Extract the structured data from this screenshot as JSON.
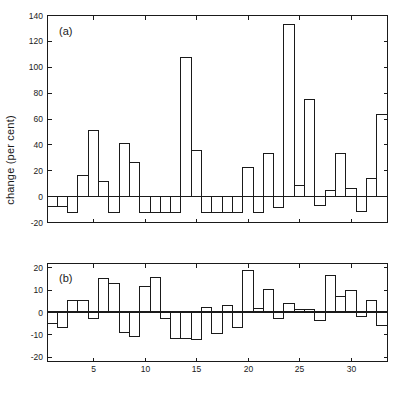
{
  "figure": {
    "ylabel": "change (per cent)",
    "background": "#ffffff",
    "ink_color": "#1a1a1a"
  },
  "chart_data": [
    {
      "type": "bar",
      "panel": "a",
      "title": "(a)",
      "xlabel": "",
      "ylabel": "change (per cent)",
      "ylim": [
        -20,
        140
      ],
      "yticks": [
        -20,
        0,
        20,
        40,
        60,
        80,
        100,
        120,
        140
      ],
      "yticklabels": [
        "-20",
        "0",
        "20",
        "40",
        "60",
        "80",
        "100",
        "120",
        "140"
      ],
      "xlim": [
        0.5,
        33.5
      ],
      "xticks": [
        5,
        10,
        15,
        20,
        25,
        30
      ],
      "xticklabels": [
        "",
        "",
        "",
        "",
        "",
        ""
      ],
      "grid": false,
      "legend": null,
      "categories": [
        1,
        2,
        3,
        4,
        5,
        6,
        7,
        8,
        9,
        10,
        11,
        12,
        13,
        14,
        15,
        16,
        17,
        18,
        19,
        20,
        21,
        22,
        23,
        24,
        25,
        26,
        27,
        28,
        29,
        30,
        31,
        32,
        33
      ],
      "values": [
        -8,
        -8,
        -13,
        16,
        51,
        11,
        -13,
        41,
        26,
        -13,
        -13,
        -13,
        -13,
        107,
        35,
        -13,
        -13,
        -13,
        -13,
        22,
        -13,
        33,
        -9,
        133,
        8,
        75,
        -7,
        4,
        33,
        6,
        -12,
        14,
        63,
        21,
        -7,
        -12,
        8
      ]
    },
    {
      "type": "bar",
      "panel": "b",
      "title": "(b)",
      "xlabel": "",
      "ylabel": "",
      "ylim": [
        -22,
        22
      ],
      "yticks": [
        -20,
        -10,
        0,
        10,
        20
      ],
      "yticklabels": [
        "-20",
        "-10",
        "0",
        "10",
        "20"
      ],
      "xlim": [
        0.5,
        33.5
      ],
      "xticks": [
        5,
        10,
        15,
        20,
        25,
        30
      ],
      "xticklabels": [
        "5",
        "10",
        "15",
        "20",
        "25",
        "30"
      ],
      "grid": false,
      "legend": null,
      "categories": [
        1,
        2,
        3,
        4,
        5,
        6,
        7,
        8,
        9,
        10,
        11,
        12,
        13,
        14,
        15,
        16,
        17,
        18,
        19,
        20,
        21,
        22,
        23,
        24,
        25,
        26,
        27,
        28,
        29,
        30,
        31,
        32,
        33
      ],
      "values": [
        -5,
        -7,
        5,
        5,
        -3,
        15,
        13,
        -9,
        -11,
        11.5,
        15.5,
        -3,
        -12,
        -12,
        -12.5,
        2,
        -9.5,
        3,
        -7,
        18.5,
        1.5,
        10,
        -3,
        4,
        1,
        1,
        -4,
        16.5,
        7,
        9.5,
        -2,
        5,
        -6
      ]
    }
  ]
}
